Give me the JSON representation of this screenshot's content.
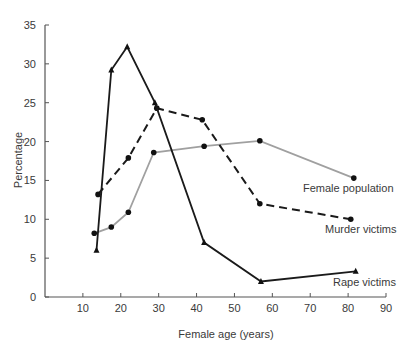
{
  "chart_data": {
    "type": "line",
    "title": "",
    "xlabel": "Female age (years)",
    "ylabel": "Percentage",
    "xlim": [
      0,
      90
    ],
    "ylim": [
      0,
      35
    ],
    "xticks": [
      10,
      20,
      30,
      40,
      50,
      60,
      70,
      80,
      90
    ],
    "yticks": [
      0,
      5,
      10,
      15,
      20,
      25,
      30,
      35
    ],
    "grid": false,
    "legend": "inline labels at line ends",
    "series": [
      {
        "name": "Female population",
        "style": "solid",
        "color": "#a0a0a0",
        "marker": "circle",
        "x": [
          13,
          17.5,
          22,
          28.7,
          42,
          56.7,
          81.5
        ],
        "y": [
          8.2,
          9.0,
          10.9,
          18.6,
          19.4,
          20.1,
          15.3
        ],
        "label_pos": [
          303,
          192
        ]
      },
      {
        "name": "Murder victims",
        "style": "dashed",
        "color": "#1a1a1a",
        "marker": "circle",
        "x": [
          14,
          22,
          29.5,
          41.5,
          56.7,
          80.7
        ],
        "y": [
          13.2,
          17.9,
          24.3,
          22.8,
          12.0,
          10.0
        ],
        "label_pos": [
          325,
          233
        ]
      },
      {
        "name": "Rape victims",
        "style": "solid",
        "color": "#1a1a1a",
        "marker": "triangle",
        "x": [
          13.6,
          17.5,
          21.7,
          29,
          42,
          57,
          82
        ],
        "y": [
          6.0,
          29.2,
          32.2,
          25.0,
          7.0,
          2.0,
          3.3
        ],
        "label_pos": [
          333,
          286
        ]
      }
    ]
  }
}
